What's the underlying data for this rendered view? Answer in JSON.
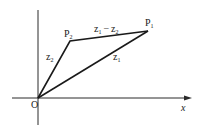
{
  "diagram": {
    "title": "",
    "axis": {
      "x_label": "x",
      "origin_label": "O"
    },
    "points": [
      {
        "id": "P1",
        "label": "P",
        "subscript": "1"
      },
      {
        "id": "P2",
        "label": "P",
        "subscript": "2"
      }
    ],
    "vectors": [
      {
        "id": "z1",
        "label": "z",
        "subscript": "1",
        "from": "O",
        "to": "P1"
      },
      {
        "id": "z2",
        "label": "z",
        "subscript": "2",
        "from": "O",
        "to": "P2"
      },
      {
        "id": "z1-z2",
        "label_a": "z",
        "sub_a": "1",
        "op": "−",
        "label_b": "z",
        "sub_b": "2",
        "from": "P2",
        "to": "P1"
      }
    ],
    "colors": {
      "ink": "#1a1a1a",
      "background": "#ffffff"
    }
  }
}
